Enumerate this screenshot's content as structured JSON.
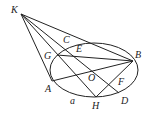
{
  "diagram": {
    "type": "geometry",
    "ellipse": {
      "cx": 94,
      "cy": 70,
      "rx": 44,
      "ry": 27
    },
    "points": {
      "K": {
        "x": 21,
        "y": 14,
        "label": "K",
        "lx": 11,
        "ly": 13
      },
      "C": {
        "x": 68,
        "y": 45,
        "label": "C",
        "lx": 63,
        "ly": 43
      },
      "E": {
        "x": 76,
        "y": 54,
        "label": "E",
        "lx": 76,
        "ly": 52
      },
      "G": {
        "x": 57,
        "y": 55,
        "label": "G",
        "lx": 44,
        "ly": 59
      },
      "B": {
        "x": 133,
        "y": 61,
        "label": "B",
        "lx": 135,
        "ly": 58
      },
      "O": {
        "x": 95,
        "y": 72,
        "label": "O",
        "lx": 88,
        "ly": 81
      },
      "A": {
        "x": 52,
        "y": 81,
        "label": "A",
        "lx": 45,
        "ly": 92
      },
      "F": {
        "x": 117,
        "y": 82,
        "label": "F",
        "lx": 118,
        "ly": 85
      },
      "H": {
        "x": 96,
        "y": 97,
        "label": "H",
        "lx": 92,
        "ly": 109
      },
      "D": {
        "x": 119,
        "y": 93,
        "label": "D",
        "lx": 121,
        "ly": 104
      },
      "a": {
        "label": "a",
        "lx": 70,
        "ly": 104
      }
    },
    "segments": [
      [
        "K",
        "A"
      ],
      [
        "K",
        "H"
      ],
      [
        "K",
        "D"
      ],
      [
        "K",
        "B"
      ],
      [
        "G",
        "B"
      ],
      [
        "A",
        "B"
      ],
      [
        "H",
        "B"
      ]
    ]
  }
}
